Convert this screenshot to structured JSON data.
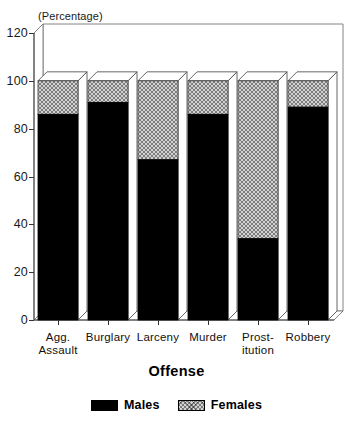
{
  "chart_data": {
    "type": "bar",
    "subtype": "stacked-bar-3d",
    "title": "",
    "unit_note": "(Percentage)",
    "xlabel": "Offense",
    "ylabel": "",
    "categories": [
      "Agg.\nAssault",
      "Burglary",
      "Larceny",
      "Murder",
      "Prost-\nitution",
      "Robbery"
    ],
    "category_names": [
      "Agg. Assault",
      "Burglary",
      "Larceny",
      "Murder",
      "Prostitution",
      "Robbery"
    ],
    "series": [
      {
        "name": "Males",
        "color": "#000000",
        "values": [
          86,
          91,
          67,
          86,
          34,
          89
        ]
      },
      {
        "name": "Females",
        "color": "#d2d2d2",
        "values": [
          14,
          9,
          33,
          14,
          66,
          11
        ]
      }
    ],
    "stack_totals": [
      100,
      100,
      100,
      100,
      100,
      100
    ],
    "ylim": [
      0,
      120
    ],
    "yticks": [
      0,
      20,
      40,
      60,
      80,
      100,
      120
    ],
    "ytick_labels": [
      "0",
      "20",
      "40",
      "60",
      "80",
      "100",
      "120"
    ],
    "grid": false,
    "legend_position": "bottom",
    "legend_entries": [
      "Males",
      "Females"
    ]
  },
  "colors": {
    "males": "#000000",
    "females": "#d2d2d2",
    "frame": "#555555",
    "text": "#111111",
    "background": "#ffffff"
  }
}
